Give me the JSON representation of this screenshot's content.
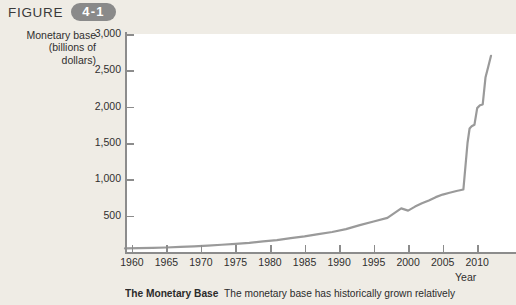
{
  "header": {
    "figure_word": "FIGURE",
    "figure_number": "4-1"
  },
  "caption": {
    "title": "The Monetary Base",
    "text": "The monetary base has historically grown relatively"
  },
  "chart_data": {
    "type": "line",
    "title": "",
    "xlabel": "Year",
    "ylabel": "Monetary base (billions of dollars)",
    "ylabel_lines": [
      "Monetary base",
      "(billions of",
      "dollars)"
    ],
    "xlim": [
      1959,
      2012
    ],
    "ylim": [
      0,
      3000
    ],
    "yticks": [
      500,
      1000,
      1500,
      2000,
      2500,
      3000
    ],
    "ytick_labels": [
      "500",
      "1,000",
      "1,500",
      "2,000",
      "2,500",
      "3,000"
    ],
    "xticks": [
      1960,
      1965,
      1970,
      1975,
      1980,
      1985,
      1990,
      1995,
      2000,
      2005,
      2010
    ],
    "xtick_labels": [
      "1960",
      "1965",
      "1970",
      "1975",
      "1980",
      "1985",
      "1990",
      "1995",
      "2000",
      "2005",
      "2010"
    ],
    "grid": false,
    "legend": false,
    "line_color": "#9a9a9a",
    "series": [
      {
        "name": "Monetary base",
        "x": [
          1959,
          1961,
          1963,
          1965,
          1967,
          1969,
          1971,
          1973,
          1975,
          1977,
          1979,
          1981,
          1983,
          1985,
          1987,
          1989,
          1991,
          1993,
          1995,
          1997,
          1999,
          2000,
          2001,
          2002,
          2003,
          2004,
          2005,
          2006,
          2007,
          2008,
          2008.6,
          2008.9,
          2009.2,
          2009.6,
          2010,
          2010.4,
          2010.8,
          2011.2,
          2011.6,
          2012
        ],
        "values": [
          50,
          52,
          56,
          62,
          70,
          78,
          88,
          100,
          112,
          126,
          145,
          163,
          190,
          215,
          245,
          275,
          315,
          370,
          420,
          470,
          600,
          570,
          625,
          670,
          710,
          755,
          790,
          815,
          840,
          860,
          1500,
          1700,
          1730,
          1750,
          1980,
          2020,
          2030,
          2400,
          2550,
          2700
        ]
      }
    ]
  }
}
